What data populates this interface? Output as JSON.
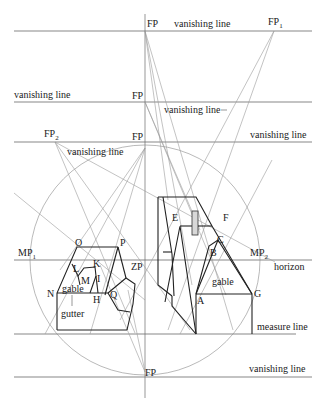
{
  "diagram": {
    "labels": {
      "fp_top": "FP",
      "fp1": "FP",
      "fp1_sub": "1",
      "fp_mid": "FP",
      "fp_third": "FP",
      "fp2": "FP",
      "fp2_sub": "2",
      "fp_bottom": "FP",
      "vl_top": "vanishing line",
      "vl_left": "vanishing line",
      "vl_mid": "vanishing line",
      "vl_right": "vanishing line",
      "vl_fp2": "vanishing line",
      "vl_bottom": "vanishing line",
      "mp1": "MP",
      "mp1_sub": "1",
      "mp2": "MP",
      "mp2_sub": "2",
      "zp": "ZP",
      "horizon": "horizon",
      "measure_line": "measure line",
      "gable_left": "gable",
      "gable_right": "gable",
      "gutter": "gutter",
      "points": {
        "A": "A",
        "B": "B",
        "C": "C",
        "E": "E",
        "F": "F",
        "G": "G",
        "H": "H",
        "I": "I",
        "K": "K",
        "L": "L",
        "M": "M",
        "N": "N",
        "O": "O",
        "P": "P",
        "Q": "Q"
      }
    },
    "colors": {
      "construction_line": "#9a9a9a",
      "object_line": "#222222",
      "background": "#ffffff"
    }
  }
}
